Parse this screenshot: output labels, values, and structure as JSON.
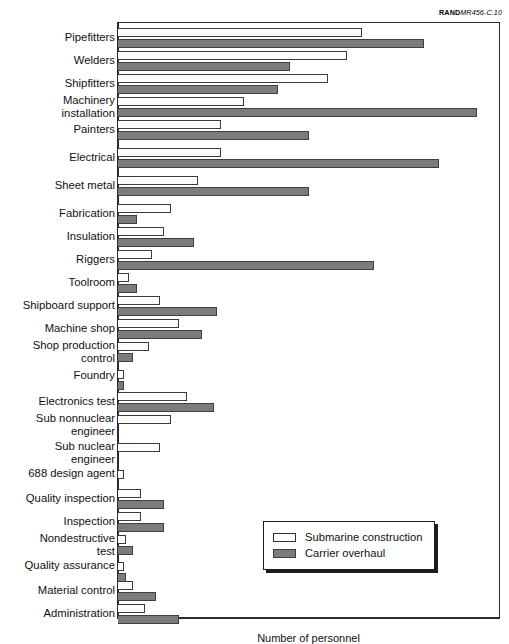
{
  "source_credit": {
    "brand": "RAND",
    "document_id": "MR456-C.10"
  },
  "legend": {
    "items": [
      {
        "label": "Submarine construction",
        "swatch": "white-bar-swatch"
      },
      {
        "label": "Carrier overhaul",
        "swatch": "gray-bar-swatch"
      }
    ]
  },
  "axis": {
    "x_caption": "Number of personnel"
  },
  "colors": {
    "submarine_construction": "#ffffff",
    "carrier_overhaul": "#7c7c7c",
    "frame": "#2b2b2b",
    "text": "#111111"
  },
  "chart_data": {
    "type": "bar",
    "orientation": "horizontal",
    "grouped": true,
    "title": "",
    "xlabel": "Number of personnel",
    "ylabel": "",
    "grid": false,
    "legend_position": "bottom-right",
    "xlim": [
      0,
      100
    ],
    "value_unit": "percent-of-axis",
    "categories": [
      "Pipefitters",
      "Welders",
      "Shipfitters",
      "Machinery installation",
      "Painters",
      "Electrical",
      "Sheet metal",
      "Fabrication",
      "Insulation",
      "Riggers",
      "Toolroom",
      "Shipboard support",
      "Machine shop",
      "Shop production control",
      "Foundry",
      "Electronics test",
      "Sub nonnuclear engineer",
      "Sub nuclear engineer",
      "688 design agent",
      "Quality inspection",
      "Inspection",
      "Nondestructive test",
      "Quality assurance",
      "Material control",
      "Administration"
    ],
    "series": [
      {
        "name": "Submarine construction",
        "color": "#ffffff",
        "values": [
          64,
          60,
          55,
          33,
          27,
          27,
          21,
          14,
          12,
          9,
          3,
          11,
          16,
          8,
          1.5,
          18,
          14,
          11,
          1.5,
          6,
          6,
          2,
          1.5,
          4,
          7
        ]
      },
      {
        "name": "Carrier overhaul",
        "color": "#7c7c7c",
        "values": [
          80,
          45,
          42,
          94,
          50,
          84,
          50,
          5,
          20,
          67,
          5,
          26,
          22,
          4,
          1.5,
          25,
          0,
          0,
          0,
          12,
          12,
          4,
          2,
          10,
          16
        ]
      }
    ]
  },
  "rows": [
    {
      "label": "Pipefitters",
      "top": 28,
      "label_top": 31,
      "sub": 64,
      "car": 80
    },
    {
      "label": "Welders",
      "top": 51,
      "label_top": 54,
      "sub": 60,
      "car": 45
    },
    {
      "label": "Shipfitters",
      "top": 74,
      "label_top": 77,
      "sub": 55,
      "car": 42
    },
    {
      "label": "Machinery\ninstallation",
      "top": 97,
      "label_top": 94,
      "sub": 33,
      "car": 94
    },
    {
      "label": "Painters",
      "top": 120,
      "label_top": 123,
      "sub": 27,
      "car": 50
    },
    {
      "label": "Electrical",
      "top": 148,
      "label_top": 151,
      "sub": 27,
      "car": 84
    },
    {
      "label": "Sheet metal",
      "top": 176,
      "label_top": 179,
      "sub": 21,
      "car": 50
    },
    {
      "label": "Fabrication",
      "top": 204,
      "label_top": 207,
      "sub": 14,
      "car": 5
    },
    {
      "label": "Insulation",
      "top": 227,
      "label_top": 230,
      "sub": 12,
      "car": 20
    },
    {
      "label": "Riggers",
      "top": 250,
      "label_top": 253,
      "sub": 9,
      "car": 67
    },
    {
      "label": "Toolroom",
      "top": 273,
      "label_top": 276,
      "sub": 3,
      "car": 5
    },
    {
      "label": "Shipboard support",
      "top": 296,
      "label_top": 299,
      "sub": 11,
      "car": 26
    },
    {
      "label": "Machine shop",
      "top": 319,
      "label_top": 322,
      "sub": 16,
      "car": 22
    },
    {
      "label": "Shop production\ncontrol",
      "top": 342,
      "label_top": 339,
      "sub": 8,
      "car": 4
    },
    {
      "label": "Foundry",
      "top": 370,
      "label_top": 369,
      "sub": 1.5,
      "car": 1.5
    },
    {
      "label": "Electronics test",
      "top": 392,
      "label_top": 395,
      "sub": 18,
      "car": 25
    },
    {
      "label": "Sub nonnuclear\nengineer",
      "top": 415,
      "label_top": 412,
      "sub": 14,
      "car": 0
    },
    {
      "label": "Sub nuclear\nengineer",
      "top": 443,
      "label_top": 440,
      "sub": 11,
      "car": 0
    },
    {
      "label": "688 design agent",
      "top": 470,
      "label_top": 467,
      "sub": 1.5,
      "car": 0
    },
    {
      "label": "Quality inspection",
      "top": 489,
      "label_top": 492,
      "sub": 6,
      "car": 12
    },
    {
      "label": "Inspection",
      "top": 512,
      "label_top": 515,
      "sub": 6,
      "car": 12
    },
    {
      "label": "Nondestructive\ntest",
      "top": 535,
      "label_top": 532,
      "sub": 2,
      "car": 4
    },
    {
      "label": "Quality assurance",
      "top": 562,
      "label_top": 559,
      "sub": 1.5,
      "car": 2
    },
    {
      "label": "Material control",
      "top": 581,
      "label_top": 584,
      "sub": 4,
      "car": 10
    },
    {
      "label": "Administration",
      "top": 604,
      "label_top": 607,
      "sub": 7,
      "car": 16
    }
  ]
}
